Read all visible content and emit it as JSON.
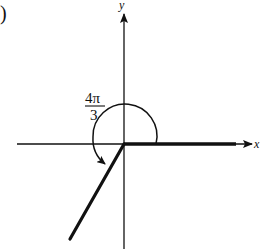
{
  "figure": {
    "part_label": ")",
    "x_axis_label": "x",
    "y_axis_label": "y",
    "angle_label": {
      "numerator": "4π",
      "denominator": "3"
    },
    "angle_radians": "4π/3",
    "angle_degrees": 240,
    "direction": "counterclockwise",
    "initial_side": "positive x-axis",
    "terminal_side_quadrant": "III",
    "colors": {
      "stroke": "#111111",
      "background": "#ffffff"
    }
  }
}
